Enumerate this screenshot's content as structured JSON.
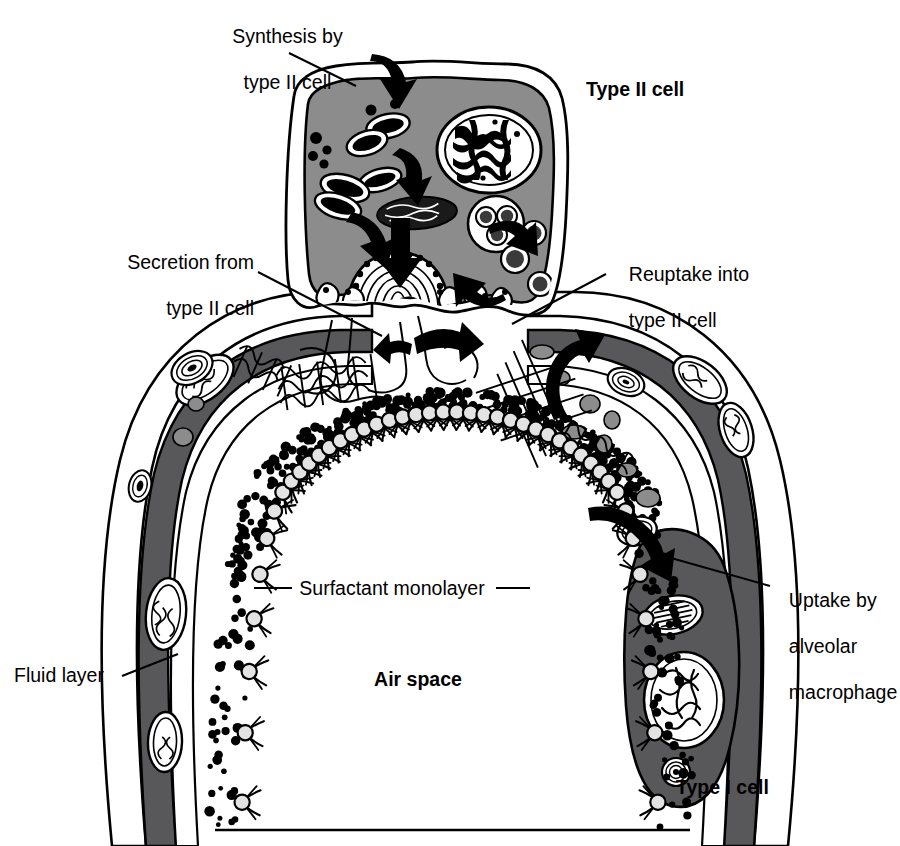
{
  "labels": {
    "synthesis": {
      "line1": "Synthesis by",
      "line2": "type II cell"
    },
    "type_ii_cell": "Type II cell",
    "secretion": {
      "line1": "Secretion from",
      "line2": "type II cell"
    },
    "reuptake": {
      "line1": "Reuptake into",
      "line2": "type II cell"
    },
    "uptake_macrophage": {
      "line1": "Uptake by",
      "line2": "alveolar",
      "line3": "macrophage"
    },
    "surfactant_monolayer": "Surfactant monolayer",
    "fluid_layer": "Fluid layer",
    "air_space": "Air space",
    "type_i_cell": "Type I cell"
  },
  "colors": {
    "background": "#ffffff",
    "outline": "#000000",
    "type_ii_cytoplasm": "#8c8c8c",
    "type_i_cytoplasm": "#58585a",
    "macrophage_cytoplasm": "#58585a",
    "surfactant_head": "#e3e3e3",
    "vesicle_gray": "#8c8c8c",
    "nucleus_fill": "#ffffff",
    "text": "#000000"
  },
  "structures": {
    "type_ii_cell": {
      "name": "Type II alveolar epithelial cell",
      "organelles": [
        "nucleus",
        "rough endoplasmic reticulum",
        "mitochondria",
        "lamellar body",
        "multivesicular body",
        "endocytic vesicles"
      ]
    },
    "type_i_cell": {
      "name": "Type I alveolar epithelial cell",
      "organelles": [
        "nucleus",
        "mitochondria",
        "lamellar-body inclusions"
      ]
    },
    "macrophage": {
      "name": "Alveolar macrophage",
      "organelles": [
        "nucleus",
        "phagosome",
        "lamellar body"
      ]
    },
    "extracellular": {
      "fluid_layer": "aqueous hypophase with dispersed surfactant particles",
      "tubular_myelin": "cross-hatched lattice of tubular myelin",
      "monolayer": "phospholipid monolayer of surfactant at the air-liquid interface",
      "air_space": "alveolar lumen"
    }
  },
  "arrows": [
    {
      "name": "synthesis-arrow",
      "from": "cytoplasmic precursors",
      "to": "endoplasmic reticulum"
    },
    {
      "name": "er-to-golgi-arrow",
      "from": "endoplasmic reticulum",
      "to": "Golgi"
    },
    {
      "name": "golgi-to-lamellar-arrow",
      "from": "Golgi",
      "to": "lamellar body"
    },
    {
      "name": "lamellar-secretion-arrow",
      "from": "lamellar body",
      "to": "alveolar hypophase"
    },
    {
      "name": "myelin-to-monolayer-arrow",
      "from": "tubular myelin",
      "to": "surfactant monolayer"
    },
    {
      "name": "reuptake-arrow",
      "from": "alveolar hypophase",
      "to": "type II cell"
    },
    {
      "name": "vesicle-recycling-arrow",
      "from": "endocytic vesicles",
      "to": "multivesicular body"
    },
    {
      "name": "macrophage-uptake-arrow",
      "from": "alveolar hypophase",
      "to": "alveolar macrophage"
    }
  ]
}
